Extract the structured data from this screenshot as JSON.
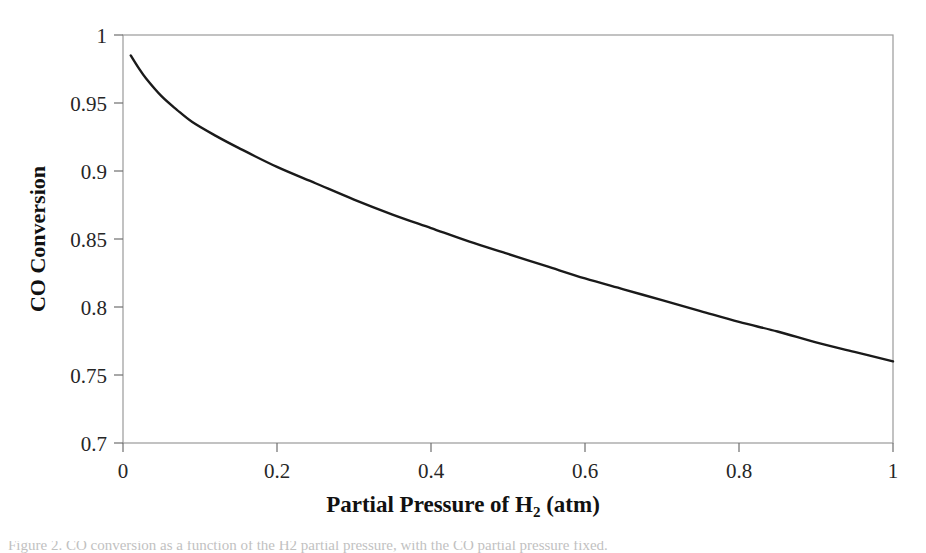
{
  "figure": {
    "background_color": "#ffffff",
    "line_color": "#1a1a1a",
    "frame_color": "#9a9a9a",
    "caption_text": "Figure 2. CO conversion as a function of the H2 partial pressure, with the CO partial pressure fixed."
  },
  "axes": {
    "x_title_main": "Partial Pressure of H",
    "x_title_sub": "2",
    "x_title_tail": " (atm)",
    "y_title": "CO Conversion",
    "x_ticks": [
      "0",
      "0.2",
      "0.4",
      "0.6",
      "0.8",
      "1"
    ],
    "y_ticks": [
      "0.7",
      "0.75",
      "0.8",
      "0.85",
      "0.9",
      "0.95",
      "1"
    ]
  },
  "chart_data": {
    "type": "line",
    "title": "",
    "xlabel": "Partial Pressure of H2 (atm)",
    "ylabel": "CO Conversion",
    "xlim": [
      0,
      1
    ],
    "ylim": [
      0.7,
      1
    ],
    "grid": false,
    "legend": "none",
    "x_tick_values": [
      0,
      0.2,
      0.4,
      0.6,
      0.8,
      1
    ],
    "y_tick_values": [
      0.7,
      0.75,
      0.8,
      0.85,
      0.9,
      0.95,
      1
    ],
    "series": [
      {
        "name": "CO conversion",
        "color": "#1a1a1a",
        "x": [
          0.01,
          0.02,
          0.03,
          0.05,
          0.07,
          0.09,
          0.12,
          0.15,
          0.2,
          0.25,
          0.3,
          0.35,
          0.4,
          0.45,
          0.5,
          0.55,
          0.6,
          0.65,
          0.7,
          0.75,
          0.8,
          0.85,
          0.9,
          0.95,
          1.0
        ],
        "y": [
          0.985,
          0.976,
          0.968,
          0.955,
          0.945,
          0.936,
          0.926,
          0.917,
          0.903,
          0.891,
          0.879,
          0.868,
          0.858,
          0.848,
          0.839,
          0.83,
          0.821,
          0.813,
          0.805,
          0.797,
          0.789,
          0.782,
          0.774,
          0.767,
          0.76
        ]
      }
    ]
  }
}
